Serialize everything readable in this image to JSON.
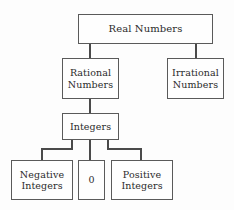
{
  "diagram": {
    "type": "tree",
    "background_color": "#fdfdfd",
    "line_color": "#4a4a4a",
    "box_border_color": "#5a5a5a",
    "box_fill_color": "#fefefe",
    "text_color": "#2b2b2b",
    "nodes": {
      "real_numbers": {
        "label": "Real Numbers",
        "line1": "Real Numbers",
        "line2": ""
      },
      "rational": {
        "label": "Rational Numbers",
        "line1": "Rational",
        "line2": "Numbers"
      },
      "irrational": {
        "label": "Irrational Numbers",
        "line1": "Irrational",
        "line2": "Numbers"
      },
      "integers": {
        "label": "Integers",
        "line1": "Integers",
        "line2": ""
      },
      "negative_integers": {
        "label": "Negative Integers",
        "line1": "Negative",
        "line2": "Integers"
      },
      "zero": {
        "label": "0",
        "line1": "0",
        "line2": ""
      },
      "positive_integers": {
        "label": "Positive Integers",
        "line1": "Positive",
        "line2": "Integers"
      }
    },
    "edges": [
      {
        "from": "real_numbers",
        "to": "rational"
      },
      {
        "from": "real_numbers",
        "to": "irrational"
      },
      {
        "from": "rational",
        "to": "integers"
      },
      {
        "from": "integers",
        "to": "negative_integers"
      },
      {
        "from": "integers",
        "to": "zero"
      },
      {
        "from": "integers",
        "to": "positive_integers"
      }
    ]
  }
}
